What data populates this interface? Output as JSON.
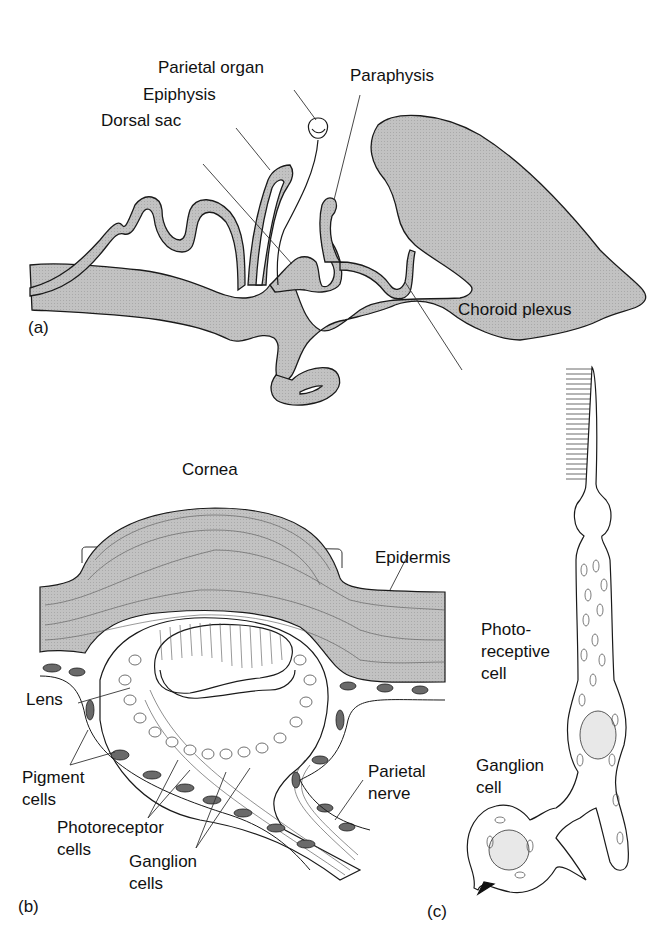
{
  "panel_a": {
    "tag": "(a)",
    "labels": {
      "parietal_organ": "Parietal organ",
      "paraphysis": "Paraphysis",
      "epiphysis": "Epiphysis",
      "dorsal_sac": "Dorsal sac",
      "choroid_plexus": "Choroid plexus"
    }
  },
  "panel_b": {
    "tag": "(b)",
    "labels": {
      "cornea": "Cornea",
      "epidermis": "Epidermis",
      "lens": "Lens",
      "pigment_1": "Pigment",
      "pigment_2": "cells",
      "photoreceptor_1": "Photoreceptor",
      "photoreceptor_2": "cells",
      "ganglion_1": "Ganglion",
      "ganglion_2": "cells",
      "parietal_nerve_1": "Parietal",
      "parietal_nerve_2": "nerve"
    }
  },
  "panel_c": {
    "tag": "(c)",
    "labels": {
      "photo_1": "Photo-",
      "photo_2": "receptive",
      "photo_3": "cell",
      "ganglion_1": "Ganglion",
      "ganglion_2": "cell"
    }
  },
  "colors": {
    "tissue_gray": "#bdbdbd",
    "outline": "#1a1a1a",
    "pigment": "#6a6a6a"
  }
}
